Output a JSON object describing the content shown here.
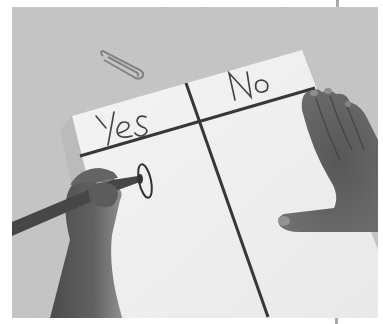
{
  "image": {
    "description": "Grayscale photo of a child's hand marking a tally circle on a Yes/No T-chart paper, with a paperclip on a gray surface and another hand resting on the right",
    "chart": {
      "columns": [
        {
          "label": "Yes",
          "marks": [
            "circle"
          ]
        },
        {
          "label": "No",
          "marks": []
        }
      ]
    },
    "objects": [
      "paper-t-chart",
      "paperclip",
      "marker",
      "writing-hand",
      "resting-hand"
    ],
    "colors": {
      "background_surface": "#b9b9b9",
      "paper": "#f2f2f2",
      "ink": "#2e2e2e",
      "skin_dark": "#555555",
      "border": "#ffffff"
    }
  }
}
